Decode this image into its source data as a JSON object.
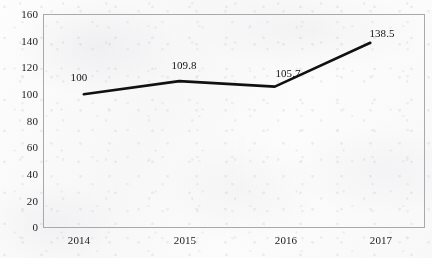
{
  "chart_data": {
    "type": "line",
    "title": "",
    "subtitle": "",
    "xlabel": "",
    "ylabel": "",
    "categories": [
      "2014",
      "2015",
      "2016",
      "2017"
    ],
    "values": [
      100,
      109.8,
      105.7,
      138.5
    ],
    "series": [
      {
        "name": "",
        "values": [
          100,
          109.8,
          105.7,
          138.5
        ],
        "color": "#111111",
        "line_width": 2.6,
        "markers": false
      }
    ],
    "data_labels": [
      "100",
      "109.8",
      "105.7",
      "138.5"
    ],
    "ylim": [
      0,
      160
    ],
    "yticks": [
      0,
      20,
      40,
      60,
      80,
      100,
      120,
      140,
      160
    ],
    "ytick_labels": [
      "0",
      "20",
      "40",
      "60",
      "80",
      "100",
      "120",
      "140",
      "160"
    ],
    "xtick_labels": [
      "2014",
      "2015",
      "2016",
      "2017"
    ],
    "grid": false,
    "legend": false,
    "legend_position": "none",
    "plot_border": true,
    "colors": {
      "line": "#111111",
      "frame": "#a9a9ad",
      "text": "#1c1c1c",
      "background": "#fbfbfb"
    }
  }
}
